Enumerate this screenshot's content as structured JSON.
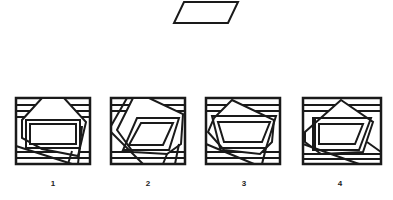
{
  "figure": {
    "type": "embedded-figures-test",
    "target_shape": "parallelogram",
    "stroke_color": "#1a1a1a",
    "background": "#ffffff"
  },
  "options": [
    {
      "label": "1",
      "inner_shape": "rectangle"
    },
    {
      "label": "2",
      "inner_shape": "parallelogram"
    },
    {
      "label": "3",
      "inner_shape": "trapezoid"
    },
    {
      "label": "4",
      "inner_shape": "trapezoid-with-vertical-lines"
    }
  ]
}
